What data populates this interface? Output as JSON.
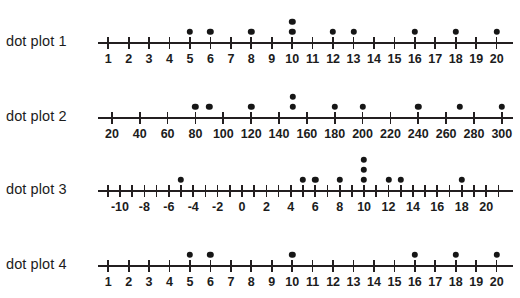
{
  "colors": {
    "ink": "#231f20",
    "dot": "#161616",
    "background": "#ffffff"
  },
  "chart_data": [
    {
      "type": "scatter",
      "title": "dot plot 1",
      "xlabel": "",
      "ylabel": "",
      "grid": false,
      "legend": "none",
      "axis_min": 0.5,
      "axis_max": 20.8,
      "tick_step": 1,
      "tick_values": [
        1,
        2,
        3,
        4,
        5,
        6,
        7,
        8,
        9,
        10,
        11,
        12,
        13,
        14,
        15,
        16,
        17,
        18,
        19,
        20
      ],
      "tick_labels": [
        "1",
        "2",
        "3",
        "4",
        "5",
        "6",
        "7",
        "8",
        "9",
        "10",
        "11",
        "12",
        "13",
        "14",
        "15",
        "16",
        "17",
        "18",
        "19",
        "20"
      ],
      "values": [
        5,
        6,
        8,
        10,
        10,
        12,
        13,
        16,
        18,
        20
      ],
      "stacks": [
        {
          "x": 5,
          "count": 1
        },
        {
          "x": 6,
          "count": 1
        },
        {
          "x": 8,
          "count": 1
        },
        {
          "x": 10,
          "count": 2
        },
        {
          "x": 12,
          "count": 1
        },
        {
          "x": 13,
          "count": 1
        },
        {
          "x": 16,
          "count": 1
        },
        {
          "x": 18,
          "count": 1
        },
        {
          "x": 20,
          "count": 1
        }
      ]
    },
    {
      "type": "scatter",
      "title": "dot plot 2",
      "xlabel": "",
      "ylabel": "",
      "grid": false,
      "legend": "none",
      "axis_min": 10,
      "axis_max": 308,
      "tick_step": 20,
      "tick_values": [
        20,
        40,
        60,
        80,
        100,
        120,
        140,
        160,
        180,
        200,
        220,
        240,
        260,
        280,
        300
      ],
      "tick_labels": [
        "20",
        "40",
        "60",
        "80",
        "100",
        "120",
        "140",
        "160",
        "180",
        "200",
        "220",
        "240",
        "260",
        "280",
        "300"
      ],
      "values": [
        80,
        90,
        120,
        150,
        150,
        180,
        200,
        240,
        270,
        300
      ],
      "stacks": [
        {
          "x": 80,
          "count": 1
        },
        {
          "x": 90,
          "count": 1
        },
        {
          "x": 120,
          "count": 1
        },
        {
          "x": 150,
          "count": 2
        },
        {
          "x": 180,
          "count": 1
        },
        {
          "x": 200,
          "count": 1
        },
        {
          "x": 240,
          "count": 1
        },
        {
          "x": 270,
          "count": 1
        },
        {
          "x": 300,
          "count": 1
        }
      ]
    },
    {
      "type": "scatter",
      "title": "dot plot 3",
      "xlabel": "",
      "ylabel": "",
      "grid": false,
      "legend": "none",
      "axis_min": -11.8,
      "axis_max": 22.2,
      "tick_step": 1,
      "tick_values": [
        -11,
        -10,
        -9,
        -8,
        -7,
        -6,
        -5,
        -4,
        -3,
        -2,
        -1,
        0,
        1,
        2,
        3,
        4,
        5,
        6,
        7,
        8,
        9,
        10,
        11,
        12,
        13,
        14,
        15,
        16,
        17,
        18,
        19,
        20,
        21
      ],
      "tick_labels": [
        "",
        "-10",
        "",
        "-8",
        "",
        "-6",
        "",
        "-4",
        "",
        "-2",
        "",
        "0",
        "",
        "2",
        "",
        "4",
        "",
        "6",
        "",
        "8",
        "",
        "10",
        "",
        "12",
        "",
        "14",
        "",
        "16",
        "",
        "18",
        "",
        "20",
        ""
      ],
      "values": [
        -5,
        5,
        6,
        8,
        10,
        10,
        10,
        12,
        13,
        18
      ],
      "stacks": [
        {
          "x": -5,
          "count": 1
        },
        {
          "x": 5,
          "count": 1
        },
        {
          "x": 6,
          "count": 1
        },
        {
          "x": 8,
          "count": 1
        },
        {
          "x": 10,
          "count": 3
        },
        {
          "x": 12,
          "count": 1
        },
        {
          "x": 13,
          "count": 1
        },
        {
          "x": 18,
          "count": 1
        }
      ]
    },
    {
      "type": "scatter",
      "title": "dot plot 4",
      "xlabel": "",
      "ylabel": "",
      "grid": false,
      "legend": "none",
      "axis_min": 0.5,
      "axis_max": 20.8,
      "tick_step": 1,
      "tick_values": [
        1,
        2,
        3,
        4,
        5,
        6,
        7,
        8,
        9,
        10,
        11,
        12,
        13,
        14,
        15,
        16,
        17,
        18,
        19,
        20
      ],
      "tick_labels": [
        "1",
        "2",
        "3",
        "4",
        "5",
        "6",
        "7",
        "8",
        "9",
        "10",
        "11",
        "12",
        "13",
        "14",
        "15",
        "16",
        "17",
        "18",
        "19",
        "20"
      ],
      "values": [
        5,
        6,
        10,
        16,
        18,
        20
      ],
      "stacks": [
        {
          "x": 5,
          "count": 1
        },
        {
          "x": 6,
          "count": 1
        },
        {
          "x": 10,
          "count": 1
        },
        {
          "x": 16,
          "count": 1
        },
        {
          "x": 18,
          "count": 1
        },
        {
          "x": 20,
          "count": 1
        }
      ]
    }
  ],
  "layout": {
    "axis_left_px": 98,
    "axis_right_px": 513,
    "row_tops": [
      12,
      87,
      160,
      235
    ],
    "row_height": 70,
    "baseline_offset": 30,
    "dot_spacing": 10,
    "first_dot_offset": 10
  }
}
